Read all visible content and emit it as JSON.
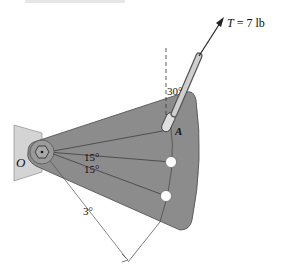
{
  "figure": {
    "type": "mechanics-diagram",
    "colors": {
      "plate": "#8c8c8c",
      "plate_edge": "#555555",
      "bracket": "#d4d4d4",
      "hole": "#ffffff",
      "line": "#333333"
    }
  },
  "labels": {
    "force": "T = 7 lb",
    "force_symbol": "T",
    "force_rest": " = 7 lb",
    "point_A": "A",
    "point_O": "O",
    "angle_vertical": "30°",
    "angle_upper": "15°",
    "angle_lower": "15°",
    "angle_small": "3°"
  },
  "icons": {
    "arrow": "arrow-head-icon",
    "pivot": "hex-pivot-icon"
  }
}
